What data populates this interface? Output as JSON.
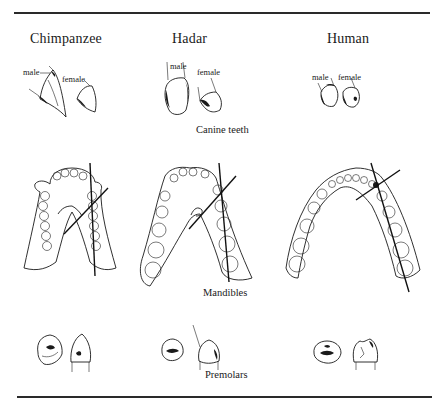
{
  "figure": {
    "columns": [
      {
        "id": "chimpanzee",
        "title": "Chimpanzee"
      },
      {
        "id": "hadar",
        "title": "Hadar"
      },
      {
        "id": "human",
        "title": "Human"
      }
    ],
    "rows": [
      {
        "id": "canines",
        "label": "Canine teeth"
      },
      {
        "id": "mandibles",
        "label": "Mandibles"
      },
      {
        "id": "premolars",
        "label": "Premolars"
      }
    ],
    "canine_labels": {
      "chimpanzee": {
        "male": "male",
        "female": "female"
      },
      "hadar": {
        "male": "male",
        "female": "female"
      },
      "human": {
        "male": "male",
        "female": "female"
      }
    },
    "colors": {
      "ink": "#1a1a1a",
      "background": "#ffffff"
    }
  }
}
